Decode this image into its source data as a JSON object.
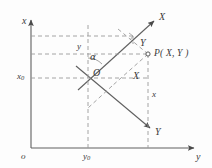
{
  "figure": {
    "type": "geometry-diagram",
    "width": 212,
    "height": 168,
    "colors": {
      "background": "#fdfdfd",
      "stroke": "#555555",
      "dashed": "#8a8a8a",
      "text": "#3a3a3a"
    }
  },
  "global_axes": {
    "vertical_axis_label": "x",
    "horizontal_axis_label": "y",
    "origin_label": "o",
    "tick_labels": {
      "vertical_offset": "x",
      "vertical_offset_sub": "0",
      "horizontal_offset": "y",
      "horizontal_offset_sub": "0"
    }
  },
  "local_axes": {
    "origin_label": "O",
    "axis_X_label": "X",
    "axis_Y_label": "Y",
    "rotation_angle_label": "α"
  },
  "point": {
    "marker": "open-circle",
    "label": "P( X, Y )",
    "coordinate_drop_labels": {
      "x_component": "x",
      "y_component": "y",
      "X_component": "X",
      "Y_component": "Y"
    }
  },
  "annotations": [
    {
      "name": "x-axis-arrow-label",
      "text": "x"
    },
    {
      "name": "y-axis-arrow-label",
      "text": "y"
    },
    {
      "name": "X-axis-arrow-label",
      "text": "X"
    },
    {
      "name": "Y-axis-arrow-label",
      "text": "Y"
    },
    {
      "name": "projection-Y-label",
      "text": "Y"
    },
    {
      "name": "projection-X-label",
      "text": "X"
    },
    {
      "name": "drop-x-label",
      "text": "x"
    },
    {
      "name": "drop-y-label",
      "text": "y"
    },
    {
      "name": "local-origin-label",
      "text": "O"
    },
    {
      "name": "global-origin-label",
      "text": "o"
    },
    {
      "name": "angle-label",
      "text": "α"
    }
  ]
}
